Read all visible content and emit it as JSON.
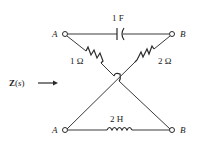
{
  "diagram": {
    "type": "lattice-network",
    "impedance_label": {
      "bold": "Z",
      "paren_open": "(",
      "var": "s",
      "paren_close": ")"
    },
    "terminals": {
      "top_left": "A",
      "top_right": "B",
      "bottom_left": "A",
      "bottom_right": "B"
    },
    "components": {
      "top_capacitor": "1 F",
      "left_diagonal_resistor": "1 Ω",
      "right_diagonal_resistor": "2 Ω",
      "bottom_inductor": "2 H"
    },
    "colors": {
      "line": "#3a3a3a",
      "background": "#ffffff"
    }
  }
}
